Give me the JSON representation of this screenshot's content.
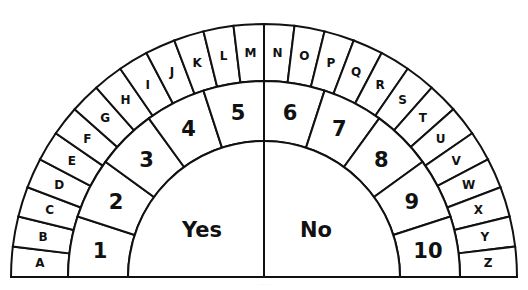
{
  "board": {
    "letters": [
      "A",
      "B",
      "C",
      "D",
      "E",
      "F",
      "G",
      "H",
      "I",
      "J",
      "K",
      "L",
      "M",
      "N",
      "O",
      "P",
      "Q",
      "R",
      "S",
      "T",
      "U",
      "V",
      "W",
      "X",
      "Y",
      "Z"
    ],
    "numbers": [
      "1",
      "2",
      "3",
      "4",
      "5",
      "6",
      "7",
      "8",
      "9",
      "10"
    ],
    "answers": {
      "yes": "Yes",
      "no": "No"
    },
    "colors": {
      "line": "#111111",
      "fill": "#ffffff",
      "text": "#111111"
    }
  },
  "geometry": {
    "cx": 264,
    "cy": 277,
    "outer_r": 253,
    "letter_inner_r": 196,
    "number_inner_r": 136
  },
  "footer": {
    "text": "· · · · ·"
  }
}
